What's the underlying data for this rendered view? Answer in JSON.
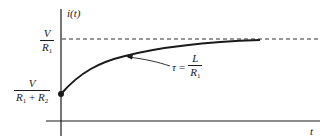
{
  "diagram": {
    "title": "",
    "type": "rl-circuit-current-response",
    "y_axis": {
      "label_main": "i",
      "label_arg": "t"
    },
    "x_axis": {
      "label": "t"
    },
    "asymptote": {
      "num": "V",
      "den_main": "R",
      "den_sub": "1",
      "style": "dashed"
    },
    "initial_value": {
      "num": "V",
      "den_a": "R",
      "den_a_sub": "1",
      "den_plus": "+",
      "den_b": "R",
      "den_b_sub": "2",
      "marker": "filled-dot"
    },
    "time_constant": {
      "symbol": "τ",
      "equals": "=",
      "num": "L",
      "den_main": "R",
      "den_sub": "1"
    },
    "colors": {
      "ink": "#1a1a1a",
      "background": "#ffffff"
    }
  }
}
